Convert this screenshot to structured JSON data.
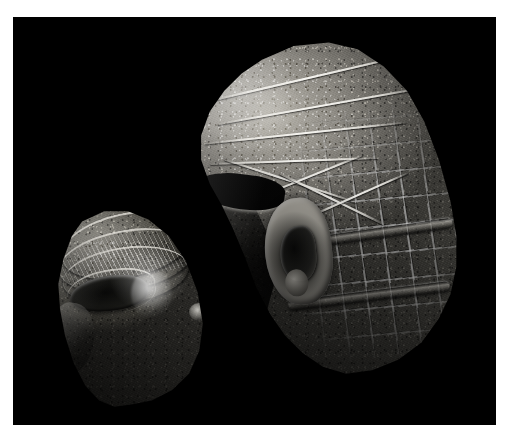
{
  "photograph": {
    "medium": "photograph",
    "subject": "two carved stone sculpture fragments",
    "background_color": "#000000",
    "mat_color": "#ffffff",
    "width_px": 515,
    "height_px": 442,
    "plate": {
      "left_px": 13,
      "top_px": 17,
      "width_px": 483,
      "height_px": 408
    },
    "lighting": "raking light from upper left",
    "color_mode": "monochrome / desaturated stone grey"
  },
  "objects": [
    {
      "id": "fragment-small",
      "label": "Small face fragment with carved eye",
      "position": "lower left",
      "bbox_px": [
        45,
        198,
        152,
        197
      ],
      "description": "Broken stone head fragment preserving a carved almond eye, raised brow ridge and banded, hatched headgear above it; fractured along the right and lower edges.",
      "features": [
        "carved-eye",
        "brow-ridge",
        "hatched-band",
        "fracture-surface",
        "pitted-stone-texture"
      ],
      "tone_range": [
        "#0b0b0a",
        "#b4b1a9"
      ]
    },
    {
      "id": "fragment-large",
      "label": "Large head fragment with grid-patterned headdress and ear",
      "position": "right of centre, upper",
      "bbox_px": [
        185,
        40,
        245,
        340
      ],
      "description": "Larger stone head fragment shown in three-quarter rear view: incised diamond and chevron lines across the crown, a deeply carved ear, a dark shadowed broken face plane at the left, and a checkerboard grid of square incisions covering the back of the head bounded by two horizontal bands.",
      "features": [
        "incised-diamond-pattern",
        "grid-checker-headdress",
        "carved-ear",
        "horizontal-bands",
        "broken-face-plane",
        "eye-socket-shadow",
        "pitted-stone-texture"
      ],
      "tone_range": [
        "#050505",
        "#c6c3ba"
      ]
    }
  ],
  "incisions": {
    "large_crown_lines": [
      {
        "left": "12%",
        "top": "11%",
        "width": "68%",
        "rotate": "-13deg"
      },
      {
        "left": "14%",
        "top": "19%",
        "width": "72%",
        "rotate": "-10deg"
      },
      {
        "left": "10%",
        "top": "27%",
        "width": "70%",
        "rotate": "-6deg"
      },
      {
        "left": "12%",
        "top": "35%",
        "width": "58%",
        "rotate": "-2deg"
      },
      {
        "left": "16%",
        "top": "41%",
        "width": "48%",
        "rotate": "18deg"
      },
      {
        "left": "24%",
        "top": "40%",
        "width": "42%",
        "rotate": "-22deg"
      },
      {
        "left": "34%",
        "top": "46%",
        "width": "40%",
        "rotate": "26deg"
      },
      {
        "left": "44%",
        "top": "45%",
        "width": "38%",
        "rotate": "-24deg"
      }
    ],
    "large_bands": [
      {
        "left": "40%",
        "top": "55%",
        "width": "56%",
        "rotate": "-8deg"
      },
      {
        "left": "39%",
        "top": "73%",
        "width": "56%",
        "rotate": "-7deg"
      }
    ],
    "small_brow_bands": [
      {
        "left": "10%",
        "top": "3%",
        "width": "78%",
        "height": "30%",
        "rotate": "-12deg"
      },
      {
        "left": "9%",
        "top": "11%",
        "width": "80%",
        "height": "28%",
        "rotate": "-10deg"
      },
      {
        "left": "11%",
        "top": "19%",
        "width": "74%",
        "height": "26%",
        "rotate": "-8deg"
      }
    ]
  },
  "caption": "Two fragments of carved stone sculpture photographed against a black ground"
}
